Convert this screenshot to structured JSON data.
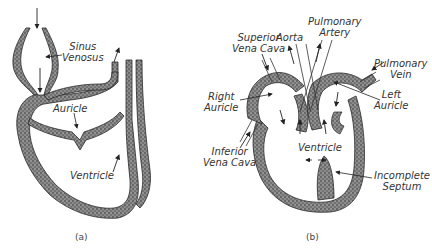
{
  "figure": {
    "panels": [
      {
        "id": "a",
        "caption": "(a)",
        "labels": {
          "sinus_venosus_1": "Sinus",
          "sinus_venosus_2": "Venosus",
          "auricle": "Auricle",
          "ventricle": "Ventricle"
        }
      },
      {
        "id": "b",
        "caption": "(b)",
        "labels": {
          "superior_vena_cava_1": "Superior",
          "superior_vena_cava_2": "Vena Cava",
          "aorta": "Aorta",
          "pulmonary_artery_1": "Pulmonary",
          "pulmonary_artery_2": "Artery",
          "pulmonary_vein_1": "Pulmonary",
          "pulmonary_vein_2": "Vein",
          "right_auricle_1": "Right",
          "right_auricle_2": "Auricle",
          "left_auricle_1": "Left",
          "left_auricle_2": "Auricle",
          "inferior_vena_cava_1": "Inferior",
          "inferior_vena_cava_2": "Vena Cava",
          "ventricle": "Ventricle",
          "incomplete_septum_1": "Incomplete",
          "incomplete_septum_2": "Septum"
        }
      }
    ],
    "colors": {
      "tissue": "#6e6e6e",
      "tissue_edge": "#2a2a2a",
      "background": "#ffffff",
      "text": "#333333"
    }
  }
}
